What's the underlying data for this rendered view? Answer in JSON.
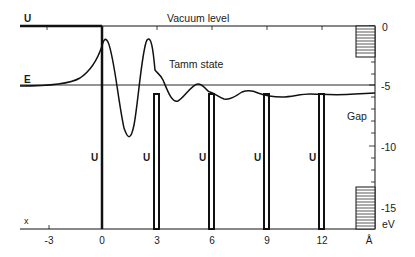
{
  "diagram": {
    "labels": {
      "vacuum_level": "Vacuum level",
      "tamm_state": "Tamm state",
      "gap": "Gap",
      "potential_U": "U",
      "energy_E": "E",
      "x_axis": "x",
      "x_unit": "Å",
      "y_unit": "eV"
    },
    "x_ticks": [
      "-3",
      "0",
      "3",
      "6",
      "9",
      "12"
    ],
    "y_ticks": [
      "0",
      "-5",
      "-10",
      "-15"
    ],
    "barrier_U_labels": [
      "U",
      "U",
      "U",
      "U",
      "U"
    ],
    "colors": {
      "line": "#111111",
      "background": "#ffffff"
    }
  }
}
